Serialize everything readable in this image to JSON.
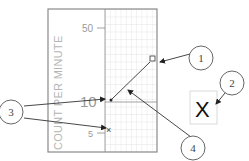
{
  "diagram": {
    "axis_label": "COUNT PER MINUTE",
    "ticks": [
      {
        "label": "50",
        "y": 27
      },
      {
        "label": "10",
        "y": 102
      },
      {
        "label": "5",
        "y": 133
      }
    ],
    "callouts": [
      {
        "id": "1",
        "label": "1",
        "points_to": "square data point at upper right"
      },
      {
        "id": "2",
        "label": "2",
        "points_to": "X symbol legend box"
      },
      {
        "id": "3",
        "label": "3",
        "points_to": "dot and x data points"
      },
      {
        "id": "4",
        "label": "4",
        "points_to": "line connecting data points"
      }
    ],
    "legend_symbol": "X",
    "colors": {
      "frame": "#8a8a8a",
      "grid": "#c8c8c8",
      "text": "#b5b5b5",
      "ink": "#333333"
    }
  }
}
